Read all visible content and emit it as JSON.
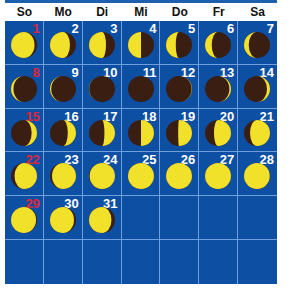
{
  "colors": {
    "grid": "#0d4fa3",
    "gridline": "#6fa0dc",
    "lit": "#f2e12a",
    "dark": "#3a1e12",
    "sunday_number": "#e0263a",
    "number": "#ffffff"
  },
  "weekdays": [
    "So",
    "Mo",
    "Di",
    "Mi",
    "Do",
    "Fr",
    "Sa"
  ],
  "days": [
    {
      "day": "1",
      "phase": 0.6
    },
    {
      "day": "2",
      "phase": 0.66
    },
    {
      "day": "3",
      "phase": 0.7
    },
    {
      "day": "4",
      "phase": 0.75
    },
    {
      "day": "5",
      "phase": 0.79
    },
    {
      "day": "6",
      "phase": 0.83
    },
    {
      "day": "7",
      "phase": 0.86
    },
    {
      "day": "8",
      "phase": 0.9
    },
    {
      "day": "9",
      "phase": 0.93
    },
    {
      "day": "10",
      "phase": 0.97
    },
    {
      "day": "11",
      "phase": 0.0
    },
    {
      "day": "12",
      "phase": 0.04
    },
    {
      "day": "13",
      "phase": 0.08
    },
    {
      "day": "14",
      "phase": 0.11
    },
    {
      "day": "15",
      "phase": 0.15
    },
    {
      "day": "16",
      "phase": 0.19
    },
    {
      "day": "17",
      "phase": 0.22
    },
    {
      "day": "18",
      "phase": 0.25
    },
    {
      "day": "19",
      "phase": 0.26
    },
    {
      "day": "20",
      "phase": 0.3
    },
    {
      "day": "21",
      "phase": 0.34
    },
    {
      "day": "22",
      "phase": 0.38
    },
    {
      "day": "23",
      "phase": 0.41
    },
    {
      "day": "24",
      "phase": 0.45
    },
    {
      "day": "25",
      "phase": 0.5
    },
    {
      "day": "26",
      "phase": 0.49
    },
    {
      "day": "27",
      "phase": 0.5
    },
    {
      "day": "28",
      "phase": 0.53
    },
    {
      "day": "29",
      "phase": 0.56
    },
    {
      "day": "30",
      "phase": 0.59
    },
    {
      "day": "31",
      "phase": 0.62
    }
  ],
  "leading_blank_cells": 0,
  "total_cells": 42
}
